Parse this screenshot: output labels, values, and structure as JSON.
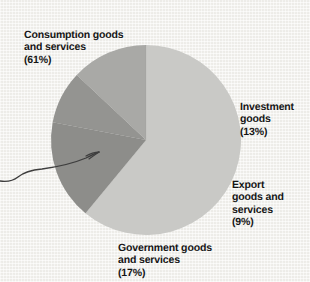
{
  "figure": {
    "background_color": "#f3f2ee",
    "width": 310,
    "height": 282
  },
  "annotation": {
    "name": "hand-drawn-pointer-arrow",
    "description": "hand drawn arrow from left margin pointing at the large light slice",
    "color": "#3c3c3c"
  },
  "labels": {
    "consumption": {
      "text": "Consumption goods\nand services",
      "percent": "(61%)"
    },
    "investment": {
      "text": "Investment\ngoods",
      "percent": "(13%)"
    },
    "export": {
      "text": "Export\ngoods and\nservices",
      "percent": "(9%)"
    },
    "government": {
      "text": "Government goods\nand services",
      "percent": "(17%)"
    }
  },
  "chart_data": {
    "type": "pie",
    "title": "",
    "subtitle": "",
    "xlabel": "",
    "ylabel": "",
    "legend": "none",
    "grid": false,
    "labels_position": "outside",
    "total_percent": 100,
    "categories": [
      "Consumption goods and services",
      "Investment goods",
      "Export goods and services",
      "Government goods and services"
    ],
    "values": [
      61,
      13,
      9,
      17
    ],
    "value_labels": [
      "(61%)",
      "(13%)",
      "(9%)",
      "(17%)"
    ],
    "colors": [
      "#c9c9c6",
      "#a9a9a6",
      "#949491",
      "#8d8d8a"
    ],
    "slices": [
      {
        "name": "Consumption goods and services",
        "value": 61,
        "label": "(61%)",
        "color": "#c9c9c6",
        "start_angle_deg": 0,
        "end_angle_deg": 219.6
      },
      {
        "name": "Government goods and services",
        "value": 17,
        "label": "(17%)",
        "color": "#8d8d8a",
        "start_angle_deg": 219.6,
        "end_angle_deg": 280.8
      },
      {
        "name": "Export goods and services",
        "value": 9,
        "label": "(9%)",
        "color": "#949491",
        "start_angle_deg": 280.8,
        "end_angle_deg": 313.2
      },
      {
        "name": "Investment goods",
        "value": 13,
        "label": "(13%)",
        "color": "#a9a9a6",
        "start_angle_deg": 313.2,
        "end_angle_deg": 360
      }
    ],
    "center": [
      146,
      140
    ],
    "radius": 95
  }
}
